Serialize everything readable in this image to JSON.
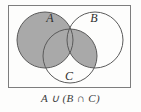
{
  "figure": {
    "type": "venn-diagram",
    "title": "A ∪ (B ∩ C)",
    "caption": "A ∪ (B ∩ C)",
    "universe_box": {
      "name": "universal-set-rectangle",
      "x": 8,
      "y": 5,
      "width": 123,
      "height": 83,
      "stroke": "#7d7d7d",
      "fill": "#fdfdfc"
    },
    "shading_color": "#a9a9a9",
    "outline_color": "#5a5a5a",
    "background_color": "#fdfdfc",
    "label_color": "#2e2e2e",
    "sets": [
      {
        "id": "A",
        "label": "A",
        "cx": 45,
        "cy": 40,
        "r": 28,
        "label_x": 50,
        "label_y": 22,
        "filled": true
      },
      {
        "id": "B",
        "label": "B",
        "cx": 95,
        "cy": 40,
        "r": 28,
        "label_x": 94,
        "label_y": 22,
        "filled": false
      },
      {
        "id": "C",
        "label": "C",
        "cx": 70,
        "cy": 56,
        "r": 27,
        "label_x": 69,
        "label_y": 80,
        "filled": false
      }
    ],
    "shaded_regions": [
      {
        "name": "set-A-region",
        "description": "entire circle A",
        "expression": "A"
      },
      {
        "name": "B-intersect-C-region",
        "description": "lens where circles B and C overlap",
        "expression": "B ∩ C"
      }
    ],
    "expression_parts": {
      "left_operand": "A",
      "union_symbol": "∪",
      "open_paren": "(",
      "right_operand_left": "B",
      "intersect_symbol": "∩",
      "right_operand_right": "C",
      "close_paren": ")"
    }
  }
}
